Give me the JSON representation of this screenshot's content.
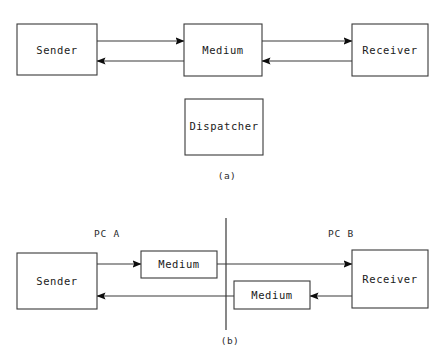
{
  "figure": {
    "background_color": "#ffffff",
    "line_color": "#3a3a3a",
    "text_color": "#1a1a1a",
    "panels": [
      {
        "id": "panel-a",
        "caption": "(a)",
        "boxes": [
          {
            "id": "a-sender",
            "label": "Sender"
          },
          {
            "id": "a-medium",
            "label": "Medium"
          },
          {
            "id": "a-receiver",
            "label": "Receiver"
          },
          {
            "id": "a-dispatcher",
            "label": "Dispatcher"
          }
        ],
        "connections": [
          {
            "id": "a-sender-to-medium",
            "from": "Sender",
            "to": "Medium",
            "direction": "right"
          },
          {
            "id": "a-medium-to-sender",
            "from": "Medium",
            "to": "Sender",
            "direction": "left"
          },
          {
            "id": "a-medium-to-receiver",
            "from": "Medium",
            "to": "Receiver",
            "direction": "right"
          },
          {
            "id": "a-receiver-to-medium",
            "from": "Receiver",
            "to": "Medium",
            "direction": "left"
          }
        ]
      },
      {
        "id": "panel-b",
        "caption": "(b)",
        "side_labels": [
          {
            "id": "pc-a",
            "label": "PC A"
          },
          {
            "id": "pc-b",
            "label": "PC B"
          }
        ],
        "boxes": [
          {
            "id": "b-sender",
            "label": "Sender"
          },
          {
            "id": "b-medium-top",
            "label": "Medium"
          },
          {
            "id": "b-medium-bottom",
            "label": "Medium"
          },
          {
            "id": "b-receiver",
            "label": "Receiver"
          }
        ],
        "connections": [
          {
            "id": "b-sender-to-medium-top",
            "from": "Sender",
            "to": "Medium",
            "direction": "right"
          },
          {
            "id": "b-medium-top-to-receiver",
            "from": "Medium",
            "to": "Receiver",
            "direction": "right"
          },
          {
            "id": "b-receiver-to-medium-bottom",
            "from": "Receiver",
            "to": "Medium",
            "direction": "left"
          },
          {
            "id": "b-medium-bottom-to-sender",
            "from": "Medium",
            "to": "Sender",
            "direction": "left"
          }
        ],
        "divider": {
          "id": "pc-boundary",
          "orientation": "vertical"
        }
      }
    ]
  }
}
